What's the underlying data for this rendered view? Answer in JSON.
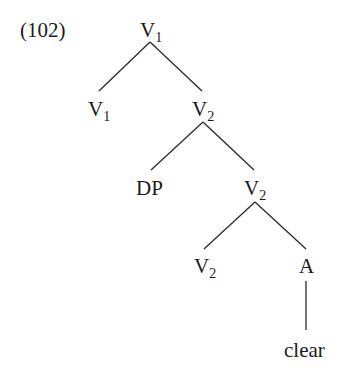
{
  "example_number": "(102)",
  "tree": {
    "root": {
      "label": "V",
      "sub": "1"
    },
    "n_v1": {
      "label": "V",
      "sub": "1"
    },
    "n_v2a": {
      "label": "V",
      "sub": "2"
    },
    "n_dp": {
      "label": "DP",
      "sub": ""
    },
    "n_v2b": {
      "label": "V",
      "sub": "2"
    },
    "n_v2c": {
      "label": "V",
      "sub": "2"
    },
    "n_a": {
      "label": "A",
      "sub": ""
    },
    "n_clear": {
      "label": "clear",
      "sub": ""
    }
  },
  "structure": "[V1 [V1] [V2 [DP] [V2 [V2] [A clear]]]]"
}
